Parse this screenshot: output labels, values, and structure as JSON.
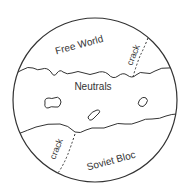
{
  "diagram": {
    "regions": [
      {
        "id": "free-world",
        "label": "Free World"
      },
      {
        "id": "neutrals",
        "label": "Neutrals"
      },
      {
        "id": "soviet-bloc",
        "label": "Soviet Bloc"
      }
    ],
    "cracks": [
      {
        "id": "crack-top",
        "label": "crack"
      },
      {
        "id": "crack-bottom",
        "label": "crack"
      }
    ],
    "colors": {
      "stroke": "#333333",
      "background": "#ffffff"
    }
  }
}
